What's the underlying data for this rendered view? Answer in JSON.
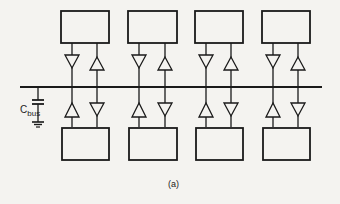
{
  "diagram": {
    "capacitor_label_main": "C",
    "capacitor_label_sub": "bus",
    "figure_label": "(a)",
    "stroke_color": "#1a1a1a",
    "background_color": "#f4f3f0",
    "bus": {
      "x1": 20,
      "x2": 322,
      "y": 87
    },
    "top_modules": [
      {
        "id": "top-1",
        "x": 61,
        "y": 11,
        "w": 48,
        "h": 32
      },
      {
        "id": "top-2",
        "x": 128,
        "y": 11,
        "w": 49,
        "h": 32
      },
      {
        "id": "top-3",
        "x": 195,
        "y": 11,
        "w": 48,
        "h": 32
      },
      {
        "id": "top-4",
        "x": 262,
        "y": 11,
        "w": 48,
        "h": 32
      }
    ],
    "bottom_modules": [
      {
        "id": "bottom-1",
        "x": 62,
        "y": 128,
        "w": 47,
        "h": 32
      },
      {
        "id": "bottom-2",
        "x": 129,
        "y": 128,
        "w": 48,
        "h": 32
      },
      {
        "id": "bottom-3",
        "x": 196,
        "y": 128,
        "w": 47,
        "h": 32
      },
      {
        "id": "bottom-4",
        "x": 263,
        "y": 128,
        "w": 47,
        "h": 32
      }
    ],
    "buffers_per_module": 2,
    "components": [
      "bus line",
      "4 top modules",
      "4 bottom modules",
      "tri-state buffers (driver and receiver) per module",
      "bus capacitance to ground"
    ]
  }
}
